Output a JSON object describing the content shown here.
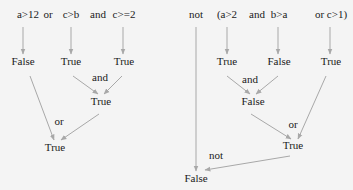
{
  "left_tree": {
    "expression_tokens": [
      {
        "id": "l_a12",
        "text": "a>12",
        "x": 28,
        "y": 14
      },
      {
        "id": "l_or",
        "text": "or",
        "x": 48,
        "y": 14
      },
      {
        "id": "l_cb",
        "text": "c>b",
        "x": 71,
        "y": 14
      },
      {
        "id": "l_and",
        "text": "and",
        "x": 98,
        "y": 14
      },
      {
        "id": "l_c2",
        "text": "c>=2",
        "x": 124,
        "y": 14
      }
    ],
    "nodes": [
      {
        "id": "l_v1",
        "text": "False",
        "x": 23,
        "y": 61
      },
      {
        "id": "l_v2",
        "text": "True",
        "x": 71,
        "y": 61
      },
      {
        "id": "l_v3",
        "text": "True",
        "x": 124,
        "y": 61
      },
      {
        "id": "l_v4",
        "text": "True",
        "x": 101,
        "y": 101
      },
      {
        "id": "l_v5",
        "text": "True",
        "x": 55,
        "y": 147
      }
    ],
    "op_labels": [
      {
        "id": "l_op_and",
        "text": "and",
        "x": 100,
        "y": 77
      },
      {
        "id": "l_op_or",
        "text": "or",
        "x": 59,
        "y": 121
      }
    ]
  },
  "right_tree": {
    "expression_tokens": [
      {
        "id": "r_not",
        "text": "not",
        "x": 196,
        "y": 14
      },
      {
        "id": "r_a2",
        "text": "(a>2",
        "x": 227,
        "y": 14
      },
      {
        "id": "r_and",
        "text": "and",
        "x": 257,
        "y": 14
      },
      {
        "id": "r_ba",
        "text": "b>a",
        "x": 279,
        "y": 14
      },
      {
        "id": "r_orc1",
        "text": "or c>1)",
        "x": 331,
        "y": 14
      }
    ],
    "nodes": [
      {
        "id": "r_v1",
        "text": "True",
        "x": 227,
        "y": 61
      },
      {
        "id": "r_v2",
        "text": "False",
        "x": 279,
        "y": 61
      },
      {
        "id": "r_v3",
        "text": "True",
        "x": 331,
        "y": 61
      },
      {
        "id": "r_v4",
        "text": "False",
        "x": 253,
        "y": 101
      },
      {
        "id": "r_v5",
        "text": "True",
        "x": 293,
        "y": 145
      },
      {
        "id": "r_v6",
        "text": "False",
        "x": 196,
        "y": 178
      }
    ],
    "op_labels": [
      {
        "id": "r_op_and",
        "text": "and",
        "x": 250,
        "y": 79
      },
      {
        "id": "r_op_or",
        "text": "or",
        "x": 293,
        "y": 124
      },
      {
        "id": "r_op_not",
        "text": "not",
        "x": 216,
        "y": 155
      }
    ]
  },
  "edges": [
    {
      "x1": 23,
      "y1": 27,
      "x2": 23,
      "y2": 54
    },
    {
      "x1": 71,
      "y1": 27,
      "x2": 71,
      "y2": 54
    },
    {
      "x1": 123,
      "y1": 27,
      "x2": 123,
      "y2": 54
    },
    {
      "x1": 73,
      "y1": 76,
      "x2": 98,
      "y2": 94
    },
    {
      "x1": 122,
      "y1": 76,
      "x2": 104,
      "y2": 94
    },
    {
      "x1": 30,
      "y1": 76,
      "x2": 54,
      "y2": 140
    },
    {
      "x1": 99,
      "y1": 114,
      "x2": 61,
      "y2": 140
    },
    {
      "x1": 227,
      "y1": 27,
      "x2": 227,
      "y2": 54
    },
    {
      "x1": 278,
      "y1": 27,
      "x2": 278,
      "y2": 54
    },
    {
      "x1": 330,
      "y1": 27,
      "x2": 330,
      "y2": 54
    },
    {
      "x1": 227,
      "y1": 76,
      "x2": 250,
      "y2": 94
    },
    {
      "x1": 278,
      "y1": 76,
      "x2": 256,
      "y2": 94
    },
    {
      "x1": 251,
      "y1": 114,
      "x2": 291,
      "y2": 139
    },
    {
      "x1": 326,
      "y1": 76,
      "x2": 298,
      "y2": 139
    },
    {
      "x1": 196,
      "y1": 27,
      "x2": 196,
      "y2": 171
    },
    {
      "x1": 290,
      "y1": 156,
      "x2": 205,
      "y2": 170
    }
  ],
  "colors": {
    "edge": "#a8a8a8",
    "text": "#1a1a1a",
    "background": "#f4f4f4"
  }
}
